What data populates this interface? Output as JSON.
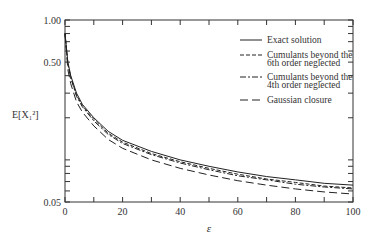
{
  "chart_data": {
    "type": "line",
    "title": "",
    "xlabel": "ε",
    "ylabel": "E[X_1^2]",
    "xlim": [
      0,
      100
    ],
    "ylim": [
      0.05,
      1.0
    ],
    "yscale": "log",
    "xticks": [
      "0",
      "20",
      "40",
      "60",
      "80",
      "100"
    ],
    "yticks": [
      "0.05",
      "0.50",
      "1.00"
    ],
    "x": [
      0,
      1,
      2,
      4,
      6,
      10,
      15,
      20,
      30,
      40,
      50,
      60,
      70,
      80,
      90,
      100
    ],
    "series": [
      {
        "name": "Exact solution",
        "style": "solid",
        "values": [
          0.8,
          0.5,
          0.4,
          0.3,
          0.25,
          0.2,
          0.16,
          0.138,
          0.115,
          0.1,
          0.09,
          0.082,
          0.076,
          0.072,
          0.068,
          0.066
        ]
      },
      {
        "name": "Cumulants beyond the 6th order neglected",
        "style": "dashed-short",
        "values": [
          0.8,
          0.49,
          0.39,
          0.29,
          0.245,
          0.195,
          0.155,
          0.134,
          0.111,
          0.097,
          0.087,
          0.079,
          0.073,
          0.069,
          0.065,
          0.063
        ]
      },
      {
        "name": "Cumulants beyond the 4th order neglected",
        "style": "dashdot",
        "values": [
          0.8,
          0.48,
          0.385,
          0.285,
          0.24,
          0.19,
          0.152,
          0.131,
          0.109,
          0.095,
          0.085,
          0.077,
          0.072,
          0.067,
          0.064,
          0.062
        ]
      },
      {
        "name": "Gaussian closure",
        "style": "dashed-long",
        "values": [
          0.8,
          0.44,
          0.35,
          0.26,
          0.22,
          0.175,
          0.14,
          0.121,
          0.1,
          0.087,
          0.078,
          0.071,
          0.066,
          0.062,
          0.059,
          0.057
        ]
      }
    ],
    "legend_position": "upper right"
  },
  "legend": [
    "Exact solution",
    "Cumulants beyond the",
    "6th order neglected",
    "Cumulants beyond the",
    "4th order neglected",
    "Gaussian closure"
  ]
}
